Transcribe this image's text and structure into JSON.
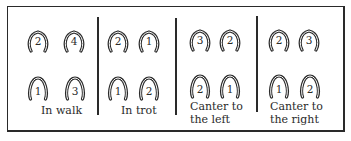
{
  "diagram": {
    "panels": [
      {
        "id": "walk",
        "label_lines": [
          "In walk"
        ],
        "front": [
          "2",
          "4"
        ],
        "hind": [
          "1",
          "3"
        ]
      },
      {
        "id": "trot",
        "label_lines": [
          "In trot"
        ],
        "front": [
          "2",
          "1"
        ],
        "hind": [
          "1",
          "2"
        ]
      },
      {
        "id": "canter-left",
        "label_lines": [
          "Canter to",
          "the left"
        ],
        "front": [
          "3",
          "2"
        ],
        "hind": [
          "2",
          "1"
        ]
      },
      {
        "id": "canter-right",
        "label_lines": [
          "Canter to",
          "the right"
        ],
        "front": [
          "2",
          "3"
        ],
        "hind": [
          "1",
          "2"
        ]
      }
    ],
    "colors": {
      "ink": "#2a2a2a",
      "background": "#ffffff"
    }
  }
}
